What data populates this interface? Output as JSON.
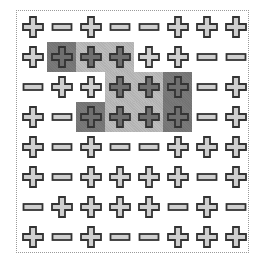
{
  "board": {
    "rows": 8,
    "cols": 8,
    "colors": {
      "icon_fill": "#cfcfcf",
      "icon_fill_shaded": "#6e6e6e",
      "icon_stroke": "#333333",
      "shade_dark": "#7a7a7a",
      "shade_light": "#bdbdbd",
      "border": "#9a9a9a"
    },
    "cells": [
      [
        "plus",
        "minus",
        "plus",
        "minus",
        "minus",
        "plus",
        "plus",
        "plus"
      ],
      [
        "plus",
        "plus",
        "plus",
        "plus",
        "plus",
        "plus",
        "minus",
        "minus"
      ],
      [
        "minus",
        "plus",
        "plus",
        "plus",
        "plus",
        "plus",
        "minus",
        "plus"
      ],
      [
        "plus",
        "minus",
        "plus",
        "plus",
        "plus",
        "plus",
        "minus",
        "plus"
      ],
      [
        "plus",
        "minus",
        "plus",
        "minus",
        "minus",
        "plus",
        "plus",
        "plus"
      ],
      [
        "plus",
        "minus",
        "plus",
        "plus",
        "plus",
        "plus",
        "minus",
        "plus"
      ],
      [
        "minus",
        "plus",
        "plus",
        "plus",
        "plus",
        "minus",
        "plus",
        "minus"
      ],
      [
        "plus",
        "minus",
        "plus",
        "minus",
        "minus",
        "plus",
        "plus",
        "plus"
      ]
    ],
    "shading": [
      [
        "",
        "",
        "",
        "",
        "",
        "",
        "",
        ""
      ],
      [
        "",
        "dark",
        "light",
        "light",
        "",
        "",
        "",
        ""
      ],
      [
        "",
        "",
        "",
        "light",
        "light",
        "dark",
        "",
        ""
      ],
      [
        "",
        "",
        "dark",
        "light",
        "light",
        "dark",
        "",
        ""
      ],
      [
        "",
        "",
        "",
        "",
        "",
        "",
        "",
        ""
      ],
      [
        "",
        "",
        "",
        "",
        "",
        "",
        "",
        ""
      ],
      [
        "",
        "",
        "",
        "",
        "",
        "",
        "",
        ""
      ],
      [
        "",
        "",
        "",
        "",
        "",
        "",
        "",
        ""
      ]
    ]
  }
}
